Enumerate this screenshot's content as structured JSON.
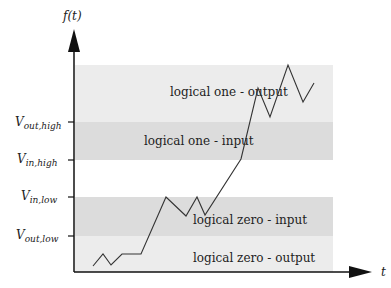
{
  "diagram": {
    "y_axis_label": "f(t)",
    "x_axis_label": "t",
    "levels": [
      {
        "main": "V",
        "sub": "out,high",
        "y": 122
      },
      {
        "main": "V",
        "sub": "in,high",
        "y": 160
      },
      {
        "main": "V",
        "sub": "in,low",
        "y": 197
      },
      {
        "main": "V",
        "sub": "out,low",
        "y": 236
      }
    ],
    "bands": [
      {
        "label": "logical one - output",
        "color": "#ececec"
      },
      {
        "label": "logical one - input",
        "color": "#dcdcdc"
      },
      {
        "label": "logical zero - input",
        "color": "#dcdcdc"
      },
      {
        "label": "logical zero - output",
        "color": "#ececec"
      }
    ],
    "waveform_points": [
      [
        93,
        266
      ],
      [
        103,
        254
      ],
      [
        111,
        265
      ],
      [
        122,
        254
      ],
      [
        141,
        254
      ],
      [
        166,
        197
      ],
      [
        186,
        216
      ],
      [
        197,
        197
      ],
      [
        205,
        215
      ],
      [
        241,
        159
      ],
      [
        258,
        88
      ],
      [
        270,
        117
      ],
      [
        288,
        65
      ],
      [
        303,
        102
      ],
      [
        314,
        83
      ]
    ]
  }
}
